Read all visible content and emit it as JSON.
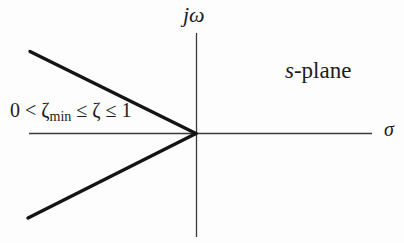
{
  "diagram": {
    "plane_label": {
      "italic": "s",
      "rest": "-plane"
    },
    "vertical_axis_label": "jω",
    "horizontal_axis_label": "σ",
    "constraint_label": {
      "prefix": "0 < ζ",
      "subscript": "min",
      "suffix": " ≤ ζ ≤ 1"
    },
    "colors": {
      "axis": "#3a3a3a",
      "boundary": "#141414",
      "background": "#fdfdfd"
    }
  }
}
